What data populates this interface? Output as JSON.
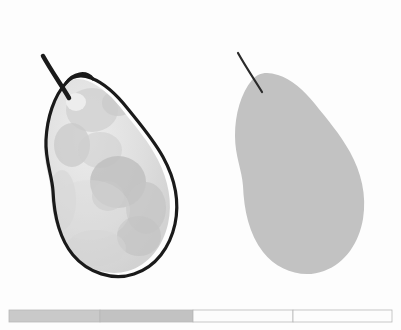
{
  "scene": {
    "title": "Pear segmentation comparison",
    "background_color": "#fdfdfd",
    "width": 401,
    "height": 330,
    "panel_count": 2
  },
  "left_panel": {
    "name": "annotated-pear",
    "description": "Grayscale photograph of a pear with a hand-drawn dark segmentation outline traced slightly outside the fruit edge",
    "fill_color": "#dcdcdc",
    "shadow_color": "#cfcfcf",
    "blotch_color": "#c3c3c3",
    "outline_color": "#1a1a1a",
    "outline_width": 3.2,
    "stem_color": "#1a1a1a",
    "stem_width": 4.5,
    "center_x": 107,
    "center_y": 175
  },
  "right_panel": {
    "name": "pear-silhouette",
    "description": "Flat gray silhouette mask of the same pear with a thin dark stem",
    "fill_color": "#c2c2c2",
    "stem_color": "#2a2a2a",
    "stem_width": 2.2,
    "center_x": 300,
    "center_y": 175
  },
  "color_bar": {
    "name": "segment-scale-bar",
    "x": 9,
    "y": 310,
    "width": 383,
    "height": 12,
    "border_color": "#b8b8b8",
    "segments": [
      {
        "label": "1",
        "start": 9,
        "end": 100,
        "color": "#c9c9c9"
      },
      {
        "label": "2",
        "start": 100,
        "end": 193,
        "color": "#c2c2c2"
      },
      {
        "label": "3",
        "start": 193,
        "end": 293,
        "color": "#fcfcfc"
      },
      {
        "label": "4",
        "start": 293,
        "end": 392,
        "color": "#fdfdfd"
      }
    ]
  }
}
